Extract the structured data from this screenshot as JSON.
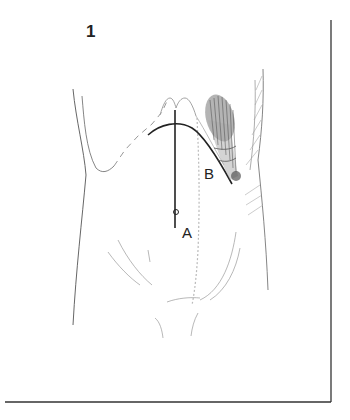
{
  "figure": {
    "number": "1",
    "labels": {
      "a": "A",
      "b": "B"
    },
    "colors": {
      "line": "#222222",
      "sketch": "#888888",
      "frame": "#333333",
      "background": "#ffffff"
    }
  }
}
